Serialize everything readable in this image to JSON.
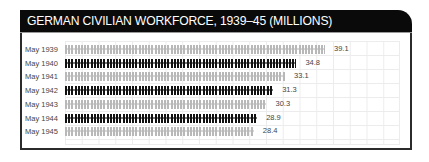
{
  "header": {
    "title": "GERMAN CIVILIAN WORKFORCE, 1939–45 (MILLIONS)"
  },
  "colors": {
    "dark": "#111111",
    "light": "#b8b8b8",
    "header_bg": "#0a0a0a"
  },
  "rows": [
    {
      "label": "May 1939",
      "value": "39.1",
      "style": "light"
    },
    {
      "label": "May 1940",
      "value": "34.8",
      "style": "dark"
    },
    {
      "label": "May 1941",
      "value": "33.1",
      "style": "light"
    },
    {
      "label": "May 1942",
      "value": "31.3",
      "style": "dark"
    },
    {
      "label": "May 1943",
      "value": "30.3",
      "style": "light"
    },
    {
      "label": "May 1944",
      "value": "28.9",
      "style": "dark"
    },
    {
      "label": "May 1945",
      "value": "28.4",
      "style": "light"
    }
  ],
  "chart_data": {
    "type": "bar",
    "orientation": "horizontal",
    "title": "GERMAN CIVILIAN WORKFORCE, 1939–45 (MILLIONS)",
    "categories": [
      "May 1939",
      "May 1940",
      "May 1941",
      "May 1942",
      "May 1943",
      "May 1944",
      "May 1945"
    ],
    "values": [
      39.1,
      34.8,
      33.1,
      31.3,
      30.3,
      28.9,
      28.4
    ],
    "xlabel": "",
    "ylabel": "",
    "unit": "millions",
    "bar_style": "pictogram (rows of worker figures), alternating light grey and black",
    "data_labels": true,
    "grid": true,
    "legend": null
  }
}
